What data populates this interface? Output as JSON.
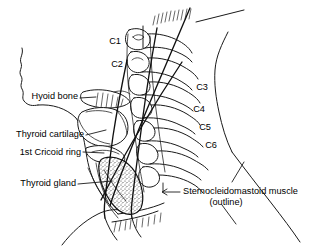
{
  "figure": {
    "name": "lateral-neck-anatomy-line-drawing",
    "background_color": "#ffffff",
    "ink_color": "#1a1a1a"
  },
  "labels": {
    "hyoid_bone": "Hyoid bone",
    "thyroid_cartilage": "Thyroid cartilage",
    "cricoid_ring": "1st Cricoid ring",
    "thyroid_gland": "Thyroid gland",
    "scm_line1": "Sternocleidomastoid muscle",
    "scm_line2": "(outline)"
  },
  "vertebrae": [
    {
      "id": "c1",
      "label": "C1",
      "x": 115,
      "y": 42
    },
    {
      "id": "c2",
      "label": "C2",
      "x": 117,
      "y": 65
    },
    {
      "id": "c3",
      "label": "C3",
      "x": 202,
      "y": 88
    },
    {
      "id": "c4",
      "label": "C4",
      "x": 199,
      "y": 110
    },
    {
      "id": "c5",
      "label": "C5",
      "x": 205,
      "y": 128
    },
    {
      "id": "c6",
      "label": "C6",
      "x": 211,
      "y": 146
    }
  ]
}
